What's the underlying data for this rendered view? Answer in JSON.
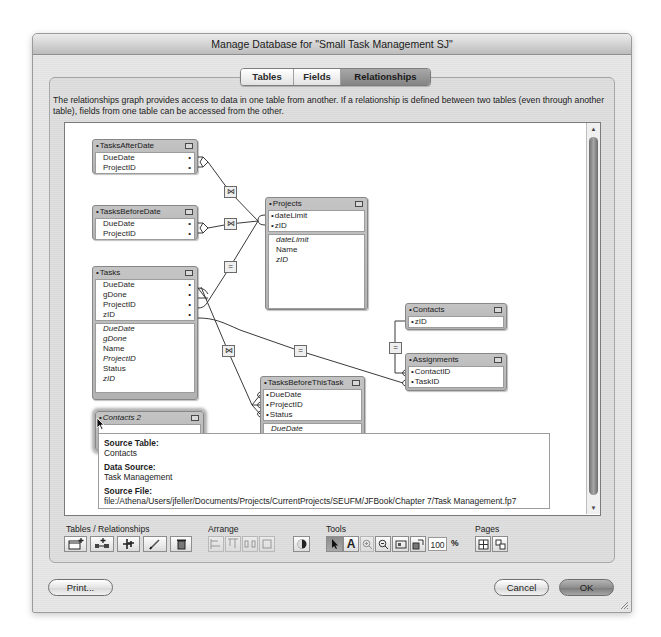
{
  "window": {
    "title": "Manage Database for \"Small Task Management SJ\""
  },
  "tabs": [
    {
      "label": "Tables",
      "selected": false
    },
    {
      "label": "Fields",
      "selected": false
    },
    {
      "label": "Relationships",
      "selected": true
    }
  ],
  "description": "The relationships graph provides access to data in one table from another. If a relationship is defined between two tables (even through another table), fields from one table can be accessed from the other.",
  "graph": {
    "tables": [
      {
        "name": "TasksAfterDate",
        "key_fields": [
          "DueDate",
          "ProjectID"
        ],
        "other_fields": []
      },
      {
        "name": "TasksBeforeDate",
        "key_fields": [
          "DueDate",
          "ProjectID"
        ],
        "other_fields": []
      },
      {
        "name": "Projects",
        "key_fields": [
          "dateLimit",
          "zID"
        ],
        "other_fields": [
          "dateLimit",
          "Name",
          "zID"
        ],
        "italic_fields": [
          "dateLimit",
          "zID"
        ]
      },
      {
        "name": "Tasks",
        "key_fields": [
          "DueDate",
          "gDone",
          "ProjectID",
          "zID"
        ],
        "other_fields": [
          "DueDate",
          "gDone",
          "Name",
          "ProjectID",
          "Status",
          "zID"
        ],
        "italic_fields": [
          "DueDate",
          "gDone",
          "ProjectID",
          "zID"
        ]
      },
      {
        "name": "Contacts",
        "key_fields": [
          "zID"
        ],
        "other_fields": []
      },
      {
        "name": "Assignments",
        "key_fields": [
          "ContactID",
          "TaskID"
        ],
        "other_fields": []
      },
      {
        "name": "TasksBeforeThisTask",
        "key_fields": [
          "DueDate",
          "ProjectID",
          "Status"
        ],
        "other_fields": [
          "DueDate"
        ]
      },
      {
        "name": "Contacts 2",
        "key_fields": [],
        "other_fields": [],
        "hovered": true
      }
    ],
    "bullet": "•",
    "relationships": [
      {
        "from": "TasksAfterDate",
        "to": "Projects",
        "operator": "⋈"
      },
      {
        "from": "TasksBeforeDate",
        "to": "Projects",
        "operator": "⋈"
      },
      {
        "from": "Tasks",
        "to": "Projects",
        "operator": "="
      },
      {
        "from": "Tasks",
        "to": "Assignments",
        "operator": "="
      },
      {
        "from": "Tasks",
        "to": "TasksBeforeThisTask",
        "operator": "⋈"
      },
      {
        "from": "Contacts",
        "to": "Assignments",
        "operator": "="
      }
    ]
  },
  "tooltip": {
    "source_table_label": "Source Table:",
    "source_table": "Contacts",
    "data_source_label": "Data Source:",
    "data_source": "Task Management",
    "source_file_label": "Source File:",
    "source_file": "file:/Athena/Users/jfeller/Documents/Projects/CurrentProjects/SEUFM/JFBook/Chapter 7/Task Management.fp7"
  },
  "scrollbar": {
    "up": "▲",
    "down": "▼"
  },
  "toolbar": {
    "tables_relationships_label": "Tables / Relationships",
    "arrange_label": "Arrange",
    "tools_label": "Tools",
    "pages_label": "Pages",
    "tables_relationships_buttons": [
      "add-table",
      "add-relationship",
      "duplicate",
      "edit",
      "delete"
    ],
    "arrange_buttons": [
      "align",
      "align-top",
      "distribute",
      "resize",
      "color"
    ],
    "tools_buttons": [
      "pointer",
      "text",
      "zoom-in",
      "zoom-out",
      "zoom-to-fit",
      "page-breaks"
    ],
    "pages_buttons": [
      "page-grid",
      "page-setup"
    ],
    "text_tool_glyph": "A",
    "zoom_value": "100",
    "zoom_unit": "%"
  },
  "buttons": {
    "print": "Print...",
    "cancel": "Cancel",
    "ok": "OK"
  }
}
